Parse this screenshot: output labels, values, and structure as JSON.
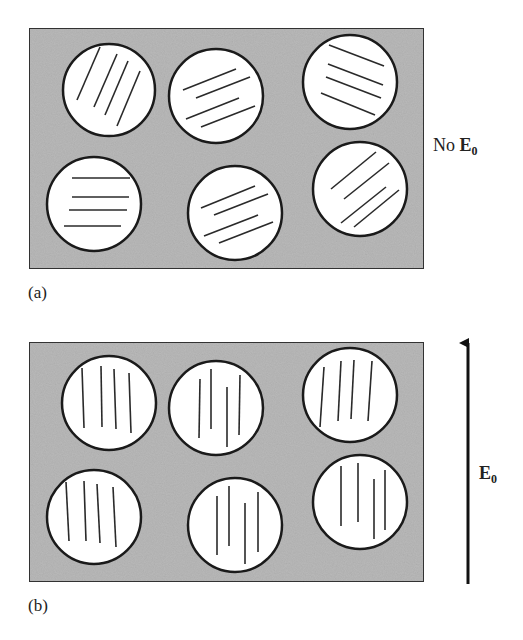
{
  "figure": {
    "panel_a": {
      "label": "(a)",
      "field_label": "No ",
      "field_symbol": "E",
      "field_subscript": "0",
      "description": "Droplets with randomly oriented director lines, no applied field",
      "matrix_color": "#b9b9b9",
      "droplets": [
        {
          "cx": 109,
          "cy": 90,
          "r": 46,
          "lines": [
            [
              77,
              100,
              100,
              47
            ],
            [
              94,
              107,
              117,
              54
            ],
            [
              105,
              115,
              128,
              61
            ],
            [
              117,
              126,
              140,
              71
            ]
          ]
        },
        {
          "cx": 216,
          "cy": 96,
          "r": 47,
          "lines": [
            [
              183,
              90,
              236,
              69
            ],
            [
              196,
              98,
              250,
              77
            ],
            [
              186,
              119,
              239,
              98
            ],
            [
              201,
              127,
              255,
              106
            ]
          ]
        },
        {
          "cx": 350,
          "cy": 82,
          "r": 47,
          "lines": [
            [
              329,
              45,
              384,
              66
            ],
            [
              328,
              64,
              383,
              85
            ],
            [
              326,
              77,
              381,
              98
            ],
            [
              321,
              93,
              375,
              115
            ]
          ]
        },
        {
          "cx": 94,
          "cy": 204,
          "r": 47,
          "lines": [
            [
              72,
              178,
              130,
              178
            ],
            [
              72,
              197,
              129,
              197
            ],
            [
              69,
              210,
              127,
              210
            ],
            [
              64,
              226,
              121,
              226
            ]
          ]
        },
        {
          "cx": 235,
          "cy": 213,
          "r": 47,
          "lines": [
            [
              201,
              208,
              255,
              186
            ],
            [
              214,
              215,
              268,
              194
            ],
            [
              204,
              236,
              258,
              215
            ],
            [
              219,
              243,
              273,
              222
            ]
          ]
        },
        {
          "cx": 360,
          "cy": 189,
          "r": 47,
          "lines": [
            [
              331,
              189,
              376,
              152
            ],
            [
              344,
              199,
              389,
              163
            ],
            [
              341,
              223,
              386,
              187
            ],
            [
              354,
              227,
              399,
              190
            ]
          ]
        }
      ]
    },
    "panel_b": {
      "label": "(b)",
      "field_symbol": "E",
      "field_subscript": "0",
      "description": "Droplet director lines aligned parallel to applied field E0",
      "matrix_color": "#b9b9b9",
      "droplets": [
        {
          "cx": 109,
          "cy": 403,
          "r": 47,
          "lines": [
            [
              82,
              368,
              84,
              428
            ],
            [
              101,
              366,
              102,
              427
            ],
            [
              114,
              369,
              116,
              429
            ],
            [
              129,
              373,
              131,
              433
            ]
          ]
        },
        {
          "cx": 216,
          "cy": 408,
          "r": 47,
          "lines": [
            [
              200,
              379,
              199,
              438
            ],
            [
              211,
              369,
              211,
              429
            ],
            [
              227,
              387,
              227,
              447
            ],
            [
              240,
              375,
              239,
              435
            ]
          ]
        },
        {
          "cx": 350,
          "cy": 395,
          "r": 47,
          "lines": [
            [
              324,
              367,
              320,
              427
            ],
            [
              341,
              361,
              338,
              421
            ],
            [
              354,
              360,
              351,
              419
            ],
            [
              372,
              361,
              368,
              421
            ]
          ]
        },
        {
          "cx": 94,
          "cy": 517,
          "r": 47,
          "lines": [
            [
              66,
              482,
              69,
              541
            ],
            [
              84,
              481,
              86,
              541
            ],
            [
              97,
              484,
              100,
              543
            ],
            [
              113,
              487,
              116,
              547
            ]
          ]
        },
        {
          "cx": 235,
          "cy": 525,
          "r": 47,
          "lines": [
            [
              217,
              496,
              217,
              555
            ],
            [
              229,
              486,
              229,
              546
            ],
            [
              245,
              503,
              245,
              564
            ],
            [
              258,
              492,
              258,
              552
            ]
          ]
        },
        {
          "cx": 360,
          "cy": 502,
          "r": 47,
          "lines": [
            [
              341,
              466,
              341,
              526
            ],
            [
              358,
              463,
              358,
              522
            ],
            [
              374,
              479,
              374,
              539
            ],
            [
              385,
              470,
              385,
              530
            ]
          ]
        }
      ]
    },
    "arrow": {
      "x": 468,
      "y_top": 341,
      "y_bottom": 584,
      "direction": "up"
    }
  }
}
